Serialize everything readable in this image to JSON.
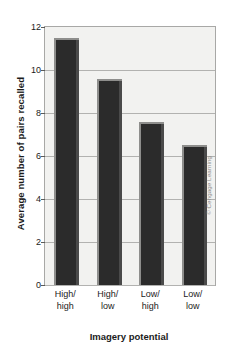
{
  "chart_data": {
    "type": "bar",
    "title": "",
    "categories": [
      "High/high",
      "High/low",
      "Low/high",
      "Low/low"
    ],
    "category_lines": [
      [
        "High/",
        "high"
      ],
      [
        "High/",
        "low"
      ],
      [
        "Low/",
        "high"
      ],
      [
        "Low/",
        "low"
      ]
    ],
    "values": [
      11.5,
      9.6,
      7.6,
      6.5
    ],
    "xlabel": "Imagery potential",
    "ylabel": "Average number of pairs recalled",
    "ylim": [
      0,
      12
    ],
    "yticks": [
      0,
      2,
      4,
      6,
      8,
      10,
      12
    ],
    "ytick_labels": [
      "0",
      "2",
      "4",
      "6",
      "8",
      "10",
      "12"
    ],
    "grid": true,
    "legend": false,
    "bar_color": "#2b2b2b",
    "plot_background": "#f2f2f0",
    "gridline_color": "#b2b2b0"
  },
  "credit": "© Cengage Learning"
}
